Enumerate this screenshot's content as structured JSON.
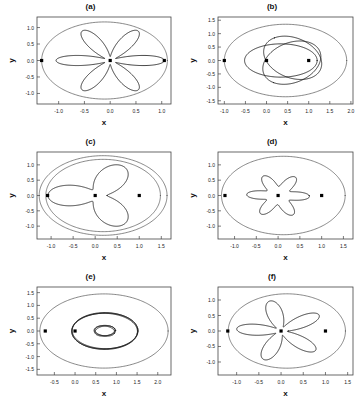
{
  "figure": {
    "axis_x_label": "x",
    "axis_y_label": "y",
    "background": "#ffffff",
    "line_color": "#1a1a1a",
    "outer_color": "#555555",
    "marker_color": "#000000"
  },
  "chart_data": [
    {
      "type": "line",
      "title": "(a)",
      "xlabel": "x",
      "ylabel": "y",
      "xlim": [
        -1.42,
        1.18
      ],
      "ylim": [
        -1.32,
        1.32
      ],
      "xticks": [
        -1.0,
        -0.5,
        0.0,
        0.5,
        1.0
      ],
      "xticklabels": [
        "-1.0",
        "-0.5",
        "0.0",
        "0.5",
        "1.0"
      ],
      "yticks": [
        -1.0,
        -0.5,
        0.0,
        0.5,
        1.0
      ],
      "yticklabels": [
        "-1.0",
        "-0.5",
        "0.0",
        "0.5",
        "1.0"
      ],
      "grid": false,
      "legend": "none",
      "description": "Six-petal rosette orbit enclosed by a bounding ellipse; focus marker at origin, apsis markers at left and right extremes",
      "series": [
        {
          "name": "bounding-ellipse",
          "shape": "ellipse",
          "cx": -0.11,
          "cy": 0.0,
          "rx": 1.22,
          "ry": 1.17
        },
        {
          "name": "rosette",
          "shape": "rose",
          "petals": 6,
          "r_max": 1.05,
          "r_min": 0.12,
          "phase_deg": 0,
          "center": [
            0.0,
            0.0
          ]
        }
      ],
      "markers": [
        {
          "x": -1.33,
          "y": 0.0
        },
        {
          "x": 0.0,
          "y": 0.0
        },
        {
          "x": 1.05,
          "y": 0.0
        }
      ]
    },
    {
      "type": "line",
      "title": "(b)",
      "xlabel": "x",
      "ylabel": "y",
      "xlim": [
        -1.15,
        2.05
      ],
      "ylim": [
        -1.62,
        1.62
      ],
      "xticks": [
        -1.0,
        -0.5,
        0.0,
        0.5,
        1.0,
        1.5,
        2.0
      ],
      "xticklabels": [
        "-1.0",
        "-0.5",
        "0.0",
        "0.5",
        "1.0",
        "1.5",
        "2.0"
      ],
      "yticks": [
        -1.5,
        -1.0,
        -0.5,
        0.0,
        0.5,
        1.0,
        1.5
      ],
      "yticklabels": [
        "-1.5",
        "-1.0",
        "-0.5",
        "0.0",
        "0.5",
        "1.0",
        "1.5"
      ],
      "grid": false,
      "legend": "none",
      "description": "Three overlapping eccentric ellipses precessing about the origin inside a large bounding ellipse",
      "series": [
        {
          "name": "bounding-ellipse",
          "shape": "ellipse",
          "cx": 0.45,
          "cy": 0.0,
          "rx": 1.45,
          "ry": 1.35
        },
        {
          "name": "orbit-1",
          "shape": "ellipse",
          "cx": 0.34,
          "cy": 0.0,
          "rx": 0.86,
          "ry": 0.62,
          "rot_deg": 0
        },
        {
          "name": "orbit-2",
          "shape": "ellipse",
          "cx": 0.62,
          "cy": 0.1,
          "rx": 0.86,
          "ry": 0.62,
          "rot_deg": 120
        },
        {
          "name": "orbit-3",
          "shape": "ellipse",
          "cx": 0.6,
          "cy": -0.08,
          "rx": 0.86,
          "ry": 0.62,
          "rot_deg": 240
        }
      ],
      "markers": [
        {
          "x": -1.0,
          "y": 0.0
        },
        {
          "x": 0.0,
          "y": 0.0
        },
        {
          "x": 1.0,
          "y": 0.0
        }
      ]
    },
    {
      "type": "line",
      "title": "(c)",
      "xlabel": "x",
      "ylabel": "y",
      "xlim": [
        -1.32,
        1.72
      ],
      "ylim": [
        -1.42,
        1.42
      ],
      "xticks": [
        -1.0,
        -0.5,
        0.0,
        0.5,
        1.0,
        1.5
      ],
      "xticklabels": [
        "-1.0",
        "-0.5",
        "0.0",
        "0.5",
        "1.0",
        "1.5"
      ],
      "yticks": [
        -1.0,
        -0.5,
        0.0,
        0.5,
        1.0
      ],
      "yticklabels": [
        "-1.0",
        "-0.5",
        "0.0",
        "0.5",
        "1.0"
      ],
      "grid": false,
      "legend": "none",
      "description": "Three-lobed precessing orbit with small inner loops, enclosed by two nested bounding ellipses",
      "series": [
        {
          "name": "bounding-ellipse-outer",
          "shape": "ellipse",
          "cx": 0.18,
          "cy": 0.0,
          "rx": 1.45,
          "ry": 1.3
        },
        {
          "name": "bounding-ellipse-inner",
          "shape": "ellipse",
          "cx": 0.18,
          "cy": 0.0,
          "rx": 1.3,
          "ry": 1.18
        },
        {
          "name": "rosette",
          "shape": "rose",
          "petals": 3,
          "r_max": 1.12,
          "r_min": 0.22,
          "phase_deg": 180,
          "center": [
            0.05,
            0.0
          ]
        }
      ],
      "markers": [
        {
          "x": -1.08,
          "y": 0.0
        },
        {
          "x": 0.0,
          "y": 0.0
        },
        {
          "x": 1.0,
          "y": 0.0
        }
      ]
    },
    {
      "type": "line",
      "title": "(d)",
      "xlabel": "x",
      "ylabel": "y",
      "xlim": [
        -1.38,
        1.72
      ],
      "ylim": [
        -1.42,
        1.42
      ],
      "xticks": [
        -1.0,
        -0.5,
        0.0,
        0.5,
        1.0,
        1.5
      ],
      "xticklabels": [
        "-1.0",
        "-0.5",
        "0.0",
        "0.5",
        "1.0",
        "1.5"
      ],
      "yticks": [
        -1.0,
        -0.5,
        0.0,
        0.5,
        1.0
      ],
      "yticklabels": [
        "-1.0",
        "-0.5",
        "0.0",
        "0.5",
        "1.0"
      ],
      "grid": false,
      "legend": "none",
      "description": "Six overlapping near-circular petal loops forming a rosette, inside a large bounding ellipse",
      "series": [
        {
          "name": "bounding-ellipse",
          "shape": "ellipse",
          "cx": 0.12,
          "cy": 0.0,
          "rx": 1.42,
          "ry": 1.28
        },
        {
          "name": "rosette",
          "shape": "rose",
          "petals": 6,
          "r_max": 0.72,
          "r_min": 0.3,
          "phase_deg": 15,
          "center": [
            0.0,
            0.0
          ]
        }
      ],
      "markers": [
        {
          "x": -1.22,
          "y": 0.0
        },
        {
          "x": 0.0,
          "y": 0.0
        },
        {
          "x": 1.0,
          "y": 0.0
        }
      ]
    },
    {
      "type": "line",
      "title": "(e)",
      "xlabel": "x",
      "ylabel": "y",
      "xlim": [
        -0.92,
        2.32
      ],
      "ylim": [
        -1.72,
        1.72
      ],
      "xticks": [
        -0.5,
        0.0,
        0.5,
        1.0,
        1.5,
        2.0
      ],
      "xticklabels": [
        "-0.5",
        "0.0",
        "0.5",
        "1.0",
        "1.5",
        "2.0"
      ],
      "yticks": [
        -1.5,
        -1.0,
        -0.5,
        0.0,
        0.5,
        1.0,
        1.5
      ],
      "yticklabels": [
        "-1.5",
        "-1.0",
        "-0.5",
        "0.0",
        "0.5",
        "1.0",
        "1.5"
      ],
      "grid": false,
      "legend": "none",
      "description": "Nested concentric ellipses: a large bounding ellipse, a thick slowly precessing middle ellipse band, and a small inner loop cluster",
      "series": [
        {
          "name": "bounding-ellipse",
          "shape": "ellipse",
          "cx": 0.7,
          "cy": 0.0,
          "rx": 1.55,
          "ry": 1.45
        },
        {
          "name": "middle-band-1",
          "shape": "ellipse",
          "cx": 0.72,
          "cy": 0.0,
          "rx": 0.8,
          "ry": 0.72,
          "rot_deg": 0
        },
        {
          "name": "middle-band-2",
          "shape": "ellipse",
          "cx": 0.72,
          "cy": 0.0,
          "rx": 0.8,
          "ry": 0.7,
          "rot_deg": 6
        },
        {
          "name": "middle-band-3",
          "shape": "ellipse",
          "cx": 0.72,
          "cy": 0.0,
          "rx": 0.79,
          "ry": 0.69,
          "rot_deg": -6
        },
        {
          "name": "inner-loop-1",
          "shape": "ellipse",
          "cx": 0.72,
          "cy": 0.02,
          "rx": 0.26,
          "ry": 0.2,
          "rot_deg": 0
        },
        {
          "name": "inner-loop-2",
          "shape": "ellipse",
          "cx": 0.72,
          "cy": 0.0,
          "rx": 0.25,
          "ry": 0.19,
          "rot_deg": 25
        },
        {
          "name": "inner-loop-3",
          "shape": "ellipse",
          "cx": 0.72,
          "cy": 0.0,
          "rx": 0.25,
          "ry": 0.19,
          "rot_deg": -25
        }
      ],
      "markers": [
        {
          "x": -0.72,
          "y": 0.0
        },
        {
          "x": 0.0,
          "y": 0.0
        }
      ]
    },
    {
      "type": "line",
      "title": "(f)",
      "xlabel": "x",
      "ylabel": "y",
      "xlim": [
        -1.42,
        1.62
      ],
      "ylim": [
        -1.42,
        1.42
      ],
      "xticks": [
        -1.0,
        -0.5,
        0.0,
        0.5,
        1.0,
        1.5
      ],
      "xticklabels": [
        "-1.0",
        "-0.5",
        "0.0",
        "0.5",
        "1.0",
        "1.5"
      ],
      "yticks": [
        -1.0,
        -0.5,
        0.0,
        0.5,
        1.0
      ],
      "yticklabels": [
        "-1.0",
        "-0.5",
        "0.0",
        "0.5",
        "1.0"
      ],
      "grid": false,
      "legend": "none",
      "description": "Five-petal rosette orbit with elongated lobes inside a bounding ellipse",
      "series": [
        {
          "name": "bounding-ellipse",
          "shape": "ellipse",
          "cx": 0.13,
          "cy": 0.0,
          "rx": 1.32,
          "ry": 1.2
        },
        {
          "name": "rosette",
          "shape": "rose",
          "petals": 5,
          "r_max": 1.0,
          "r_min": 0.14,
          "phase_deg": 200,
          "center": [
            0.0,
            0.0
          ]
        }
      ],
      "markers": [
        {
          "x": -1.2,
          "y": 0.0
        },
        {
          "x": 0.0,
          "y": 0.0
        },
        {
          "x": 1.0,
          "y": 0.0
        }
      ]
    }
  ]
}
